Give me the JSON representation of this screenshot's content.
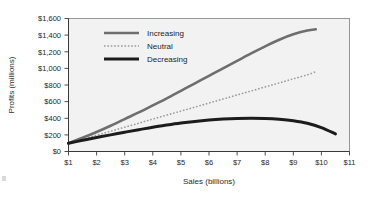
{
  "chart_data": {
    "type": "line",
    "title": "",
    "xlabel": "Sales (billions)",
    "ylabel": "Profits (millions)",
    "xlim": [
      1,
      11
    ],
    "ylim": [
      0,
      1600
    ],
    "xtick_labels": [
      "$1",
      "$2",
      "$3",
      "$4",
      "$5",
      "$6",
      "$7",
      "$8",
      "$9",
      "$10",
      "$11"
    ],
    "xtick_values": [
      1,
      2,
      3,
      4,
      5,
      6,
      7,
      8,
      9,
      10,
      11
    ],
    "ytick_labels": [
      "$0",
      "$200",
      "$400",
      "$600",
      "$800",
      "$1,000",
      "$1,200",
      "$1,400",
      "$1,600"
    ],
    "ytick_values": [
      0,
      200,
      400,
      600,
      800,
      1000,
      1200,
      1400,
      1600
    ],
    "grid": false,
    "legend_position": "upper-left-inside",
    "x": [
      1,
      1.5,
      2,
      2.5,
      3,
      3.5,
      4,
      4.5,
      5,
      5.5,
      6,
      6.5,
      7,
      7.5,
      8,
      8.5,
      9,
      9.5,
      9.8,
      10.2,
      10.5
    ],
    "series": [
      {
        "name": "Increasing",
        "style": "solid",
        "color": "#6e6e6e",
        "x": [
          1,
          1.5,
          2,
          2.5,
          3,
          3.5,
          4,
          4.5,
          5,
          5.5,
          6,
          6.5,
          7,
          7.5,
          8,
          8.5,
          9,
          9.5,
          9.8
        ],
        "values": [
          100,
          165,
          235,
          310,
          390,
          470,
          555,
          640,
          730,
          820,
          910,
          1000,
          1090,
          1180,
          1265,
          1345,
          1410,
          1455,
          1470
        ]
      },
      {
        "name": "Neutral",
        "style": "dotted",
        "color": "#9a9a9a",
        "x": [
          1,
          1.5,
          2,
          2.5,
          3,
          3.5,
          4,
          4.5,
          5,
          5.5,
          6,
          6.5,
          7,
          7.5,
          8,
          8.5,
          9,
          9.5,
          9.8
        ],
        "values": [
          100,
          148,
          196,
          244,
          292,
          340,
          390,
          438,
          486,
          534,
          583,
          631,
          680,
          728,
          777,
          825,
          874,
          922,
          960
        ]
      },
      {
        "name": "Decreasing",
        "style": "solid-thick",
        "color": "#1c1c1c",
        "x": [
          1,
          1.5,
          2,
          2.5,
          3,
          3.5,
          4,
          4.5,
          5,
          5.5,
          6,
          6.5,
          7,
          7.5,
          8,
          8.5,
          9,
          9.5,
          10,
          10.5
        ],
        "values": [
          100,
          135,
          168,
          200,
          232,
          262,
          292,
          318,
          342,
          362,
          378,
          390,
          398,
          401,
          398,
          388,
          370,
          340,
          288,
          212
        ]
      }
    ]
  },
  "legend": {
    "items": [
      {
        "label": "Increasing"
      },
      {
        "label": "Neutral"
      },
      {
        "label": "Decreasing"
      }
    ]
  }
}
